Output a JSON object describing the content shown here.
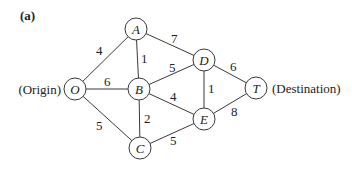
{
  "panel_label": "(a)",
  "origin_label": "(Origin)",
  "destination_label": "(Destination)",
  "nodes": {
    "O": {
      "label": "O",
      "x": 75,
      "y": 89
    },
    "A": {
      "label": "A",
      "x": 136,
      "y": 29
    },
    "B": {
      "label": "B",
      "x": 139,
      "y": 89
    },
    "C": {
      "label": "C",
      "x": 140,
      "y": 148
    },
    "D": {
      "label": "D",
      "x": 204,
      "y": 60
    },
    "E": {
      "label": "E",
      "x": 204,
      "y": 119
    },
    "T": {
      "label": "T",
      "x": 256,
      "y": 88
    }
  },
  "edges": [
    {
      "from": "O",
      "to": "A",
      "weight": "4"
    },
    {
      "from": "O",
      "to": "B",
      "weight": "6"
    },
    {
      "from": "O",
      "to": "C",
      "weight": "5"
    },
    {
      "from": "A",
      "to": "B",
      "weight": "1"
    },
    {
      "from": "A",
      "to": "D",
      "weight": "7"
    },
    {
      "from": "B",
      "to": "D",
      "weight": "5"
    },
    {
      "from": "B",
      "to": "E",
      "weight": "4"
    },
    {
      "from": "B",
      "to": "C",
      "weight": "2"
    },
    {
      "from": "C",
      "to": "E",
      "weight": "5"
    },
    {
      "from": "D",
      "to": "E",
      "weight": "1"
    },
    {
      "from": "D",
      "to": "T",
      "weight": "6"
    },
    {
      "from": "E",
      "to": "T",
      "weight": "8"
    }
  ]
}
